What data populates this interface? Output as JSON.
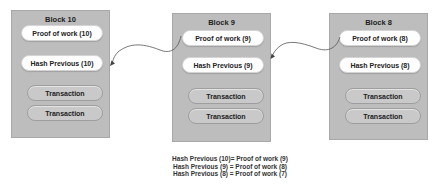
{
  "blocks": [
    {
      "id": "block-10",
      "title": "Block 10",
      "proof_of_work": "Proof of work (10)",
      "hash_previous": "Hash Previous (10)",
      "transactions": [
        "Transaction",
        "Transaction"
      ]
    },
    {
      "id": "block-9",
      "title": "Block 9",
      "proof_of_work": "Proof of work (9)",
      "hash_previous": "Hash Previous (9)",
      "transactions": [
        "Transaction",
        "Transaction"
      ]
    },
    {
      "id": "block-8",
      "title": "Block 8",
      "proof_of_work": "Proof of work (8)",
      "hash_previous": "Hash Previous (8)",
      "transactions": [
        "Transaction",
        "Transaction"
      ]
    }
  ],
  "arrows": [
    {
      "from": "Proof of work (9)",
      "to": "Block 10"
    },
    {
      "from": "Proof of work (8)",
      "to": "Block 9"
    }
  ],
  "caption": [
    "Hash Previous (10)= Proof of work (9)",
    "Hash Previous (9) = Proof of work (8)",
    "Hash Previous (8) = Proof of work (7)"
  ],
  "colors": {
    "block_fill": "#bdbdbd",
    "pill_white": "#ffffff",
    "pill_gray": "#c9c9c9",
    "arrow": "#555555",
    "text": "#222222"
  }
}
